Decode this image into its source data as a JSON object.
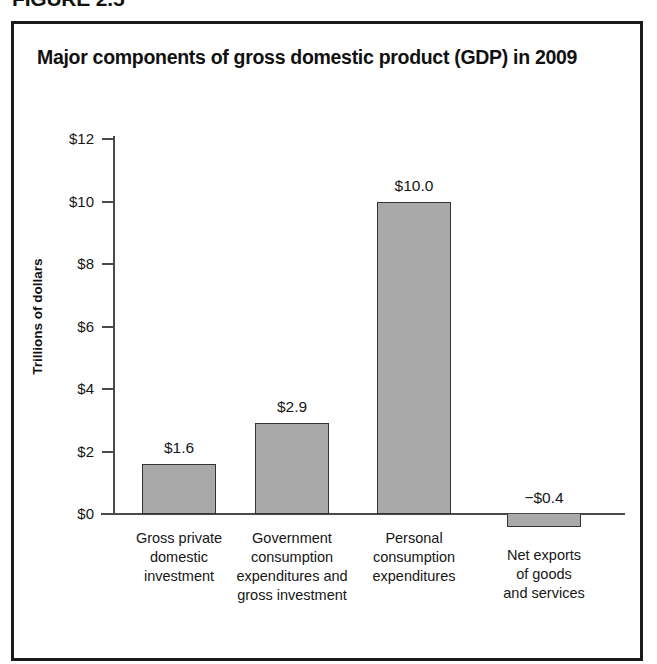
{
  "figure": {
    "number_label": "FIGURE 2.5"
  },
  "chart_data": {
    "type": "bar",
    "title": "Major components of gross domestic product (GDP) in 2009",
    "xlabel": "",
    "ylabel": "Trillions of dollars",
    "categories": [
      "Gross private domestic investment",
      "Government consumption expenditures and gross investment",
      "Personal consumption expenditures",
      "Net exports of goods and services"
    ],
    "category_lines": [
      [
        "Gross private",
        "domestic",
        "investment"
      ],
      [
        "Government",
        "consumption",
        "expenditures and",
        "gross investment"
      ],
      [
        "Personal",
        "consumption",
        "expenditures"
      ],
      [
        "Net exports",
        "of goods",
        "and services"
      ]
    ],
    "values": [
      1.6,
      2.9,
      10.0,
      -0.4
    ],
    "value_labels": [
      "$1.6",
      "$2.9",
      "$10.0",
      "−$0.4"
    ],
    "ylim": [
      0,
      12
    ],
    "ytick_values": [
      0,
      2,
      4,
      6,
      8,
      10,
      12
    ],
    "ytick_labels": [
      "$0",
      "$2",
      "$4",
      "$6",
      "$8",
      "$10",
      "$12"
    ],
    "grid": false,
    "legend": "none",
    "bar_fill_color": "#a9a9a9",
    "bar_border_color": "#333333",
    "axis_color": "#4a4a4a",
    "text_color": "#161616",
    "background_color": "#ffffff"
  }
}
